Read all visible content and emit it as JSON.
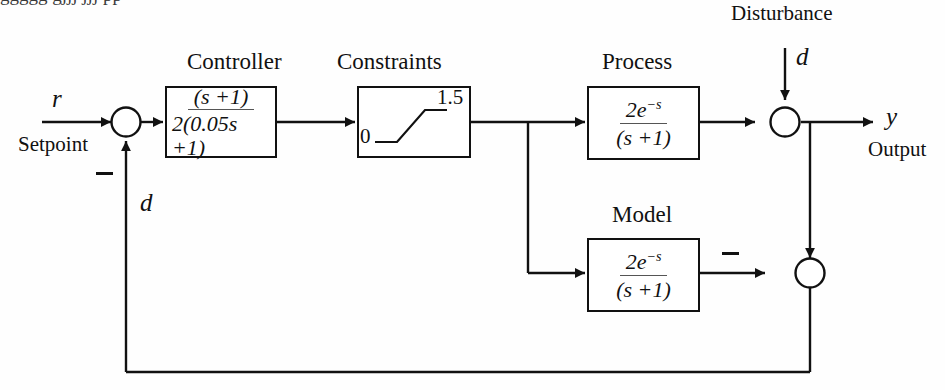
{
  "figure": {
    "kind": "control-block-diagram",
    "scheme": "Internal Model Control (IMC) with actuator constraints",
    "stroke_color": "#111111",
    "background_color": "#fefefe"
  },
  "blocks": {
    "controller": {
      "title": "Controller",
      "numerator": "(s +1)",
      "denominator": "2(0.05s +1)"
    },
    "constraints": {
      "title": "Constraints",
      "lower_limit": "0",
      "upper_limit": "1.5"
    },
    "process": {
      "title": "Process",
      "numerator_base": "2e",
      "numerator_exponent": "−s",
      "denominator": "(s +1)"
    },
    "model": {
      "title": "Model",
      "numerator_base": "2e",
      "numerator_exponent": "−s",
      "denominator": "(s +1)"
    }
  },
  "signals": {
    "reference_symbol": "r",
    "reference_word": "Setpoint",
    "output_symbol": "y",
    "output_word": "Output",
    "disturbance_word": "Disturbance",
    "disturbance_symbol": "d",
    "feedback_symbol": "d"
  },
  "junctions": {
    "error_sum_sign": "−",
    "model_error_sum_sign": "−"
  },
  "caption_fragment": "ggggg  gjjj  jjj  pp"
}
